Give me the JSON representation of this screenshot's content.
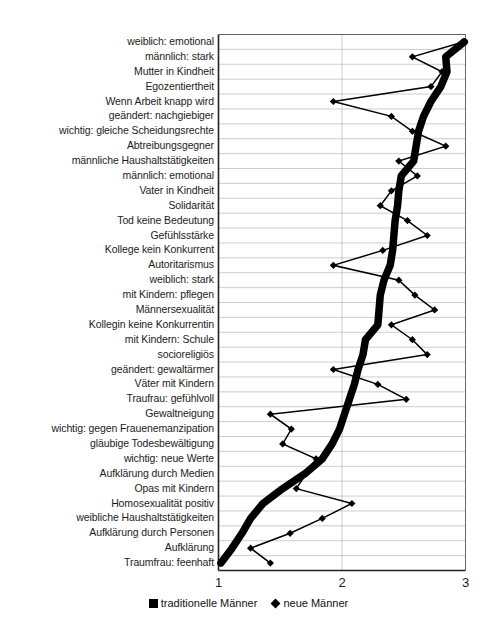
{
  "chart_data": {
    "type": "line",
    "orientation": "horizontal",
    "title": "",
    "subtitle": "",
    "xlabel": "",
    "ylabel": "",
    "xlim": [
      1,
      3
    ],
    "xticks": [
      1,
      2,
      3
    ],
    "xtick_labels": [
      "1",
      "2",
      "3"
    ],
    "grid": true,
    "grid_axis": "y",
    "legend_position": "bottom",
    "categories": [
      "weiblich: emotional",
      "männlich: stark",
      "Mutter in Kindheit",
      "Egozentiertheit",
      "Wenn Arbeit knapp wird",
      "geändert: nachgiebiger",
      "wichtig: gleiche Scheidungsrechte",
      "Abtreibungsgegner",
      "männliche Haushaltstätigkeiten",
      "männlich: emotional",
      "Vater in Kindheit",
      "Solidarität",
      "Tod keine Bedeutung",
      "Gefühlsstärke",
      "Kollege kein Konkurrent",
      "Autoritarismus",
      "weiblich: stark",
      "mit Kindern: pflegen",
      "Männersexualität",
      "Kollegin keine Konkurrentin",
      "mit Kindern: Schule",
      "socioreligiös",
      "geändert: gewaltärmer",
      "Väter mit Kindern",
      "Traufrau: gefühlvoll",
      "Gewaltneigung",
      "wichtig: gegen Frauenemanzipation",
      "gläubige Todesbewältigung",
      "wichtig: neue Werte",
      "Aufklärung durch Medien",
      "Opas mit Kindern",
      "Homosexualität positiv",
      "weibliche Haushaltstätigkeiten",
      "Aufklärung durch Personen",
      "Aufklärung",
      "Traumfrau: feenhaft"
    ],
    "series": [
      {
        "name": "traditionelle Männer",
        "marker": "square",
        "line_width": "thick",
        "color": "#000000",
        "values": [
          2.99,
          2.84,
          2.85,
          2.8,
          2.72,
          2.66,
          2.62,
          2.6,
          2.58,
          2.48,
          2.46,
          2.45,
          2.43,
          2.42,
          2.41,
          2.39,
          2.34,
          2.31,
          2.3,
          2.29,
          2.19,
          2.17,
          2.13,
          2.1,
          2.06,
          2.02,
          1.98,
          1.92,
          1.84,
          1.7,
          1.52,
          1.36,
          1.26,
          1.19,
          1.11,
          1.02
        ]
      },
      {
        "name": "neue Männer",
        "marker": "diamond",
        "line_width": "thin",
        "color": "#000000",
        "values": [
          2.98,
          2.57,
          2.81,
          2.72,
          1.93,
          2.4,
          2.57,
          2.84,
          2.46,
          2.61,
          2.4,
          2.31,
          2.53,
          2.69,
          2.33,
          1.93,
          2.46,
          2.59,
          2.75,
          2.4,
          2.57,
          2.69,
          1.93,
          2.29,
          2.52,
          1.42,
          1.59,
          1.52,
          1.79,
          1.71,
          1.63,
          2.08,
          1.84,
          1.58,
          1.26,
          1.42
        ]
      }
    ]
  },
  "axis": {
    "ticks": [
      "1",
      "2",
      "3"
    ]
  },
  "legend": {
    "entries": [
      {
        "label": "traditionelle Männer",
        "marker": "square-marker-icon"
      },
      {
        "label": "neue Männer",
        "marker": "diamond-marker-icon"
      }
    ]
  }
}
